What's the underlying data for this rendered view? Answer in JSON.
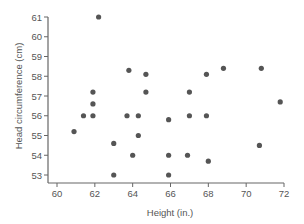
{
  "chart_data": {
    "type": "scatter",
    "title": "",
    "xlabel": "Height (in.)",
    "ylabel": "Head circumference (cm)",
    "xlim": [
      60,
      72
    ],
    "ylim": [
      53,
      61
    ],
    "xticks": [
      60,
      62,
      64,
      66,
      68,
      70,
      72
    ],
    "yticks": [
      53,
      54,
      55,
      56,
      57,
      58,
      59,
      60,
      61
    ],
    "grid": false,
    "legend": null,
    "marker_color": "#555555",
    "points": [
      {
        "x": 60.9,
        "y": 55.2
      },
      {
        "x": 61.4,
        "y": 56.0
      },
      {
        "x": 61.9,
        "y": 56.0
      },
      {
        "x": 61.9,
        "y": 56.6
      },
      {
        "x": 61.9,
        "y": 57.2
      },
      {
        "x": 62.2,
        "y": 61.0
      },
      {
        "x": 63.0,
        "y": 54.6
      },
      {
        "x": 63.0,
        "y": 53.0
      },
      {
        "x": 63.7,
        "y": 56.0
      },
      {
        "x": 63.8,
        "y": 58.3
      },
      {
        "x": 64.0,
        "y": 54.0
      },
      {
        "x": 64.3,
        "y": 56.0
      },
      {
        "x": 64.3,
        "y": 55.0
      },
      {
        "x": 64.7,
        "y": 57.2
      },
      {
        "x": 64.7,
        "y": 58.1
      },
      {
        "x": 65.9,
        "y": 55.8
      },
      {
        "x": 65.9,
        "y": 54.0
      },
      {
        "x": 65.9,
        "y": 53.0
      },
      {
        "x": 66.9,
        "y": 54.0
      },
      {
        "x": 67.0,
        "y": 57.2
      },
      {
        "x": 67.0,
        "y": 56.0
      },
      {
        "x": 67.9,
        "y": 58.1
      },
      {
        "x": 67.9,
        "y": 56.0
      },
      {
        "x": 68.0,
        "y": 53.7
      },
      {
        "x": 68.8,
        "y": 58.4
      },
      {
        "x": 70.7,
        "y": 54.5
      },
      {
        "x": 70.8,
        "y": 58.4
      },
      {
        "x": 71.8,
        "y": 56.7
      }
    ]
  },
  "layout": {
    "plot_left": 57,
    "plot_right": 284,
    "plot_top": 17,
    "plot_bottom": 175,
    "axis_bottom": 183,
    "axis_left": 48
  }
}
